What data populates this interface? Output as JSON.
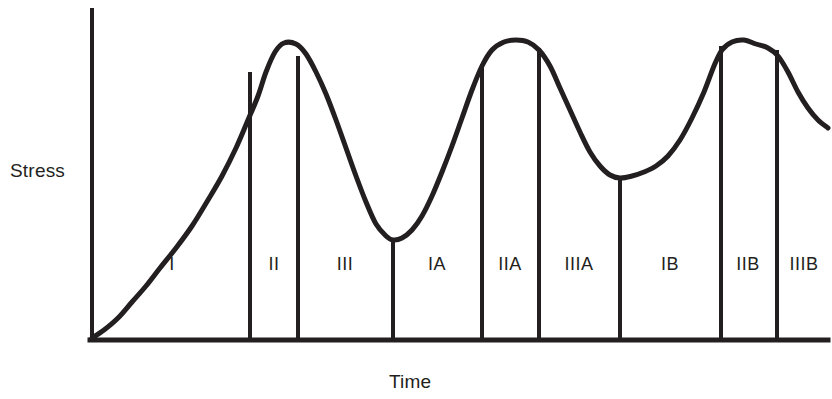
{
  "figure": {
    "background_color": "#ffffff",
    "ink_color": "#231f20"
  },
  "axes": {
    "y_axis_label": "Stress",
    "x_axis_label": "Time",
    "y_axis": {
      "x": 92,
      "y_top": 10,
      "y_bottom": 340
    },
    "x_axis": {
      "y": 340,
      "x_left": 92,
      "x_right": 828
    }
  },
  "stage_labels": [
    {
      "text": "I",
      "x": 172,
      "y": 254
    },
    {
      "text": "II",
      "x": 274,
      "y": 254
    },
    {
      "text": "III",
      "x": 345,
      "y": 254
    },
    {
      "text": "IA",
      "x": 437,
      "y": 254
    },
    {
      "text": "IIA",
      "x": 510,
      "y": 254
    },
    {
      "text": "IIIA",
      "x": 579,
      "y": 254
    },
    {
      "text": "IB",
      "x": 670,
      "y": 254
    },
    {
      "text": "IIB",
      "x": 748,
      "y": 254
    },
    {
      "text": "IIIB",
      "x": 804,
      "y": 254
    }
  ],
  "dividers": [
    {
      "x": 250,
      "y_top": 72,
      "label_after": "II"
    },
    {
      "x": 298,
      "y_top": 56,
      "label_after": "III"
    },
    {
      "x": 393,
      "y_top": 240,
      "label_after": "IA"
    },
    {
      "x": 482,
      "y_top": 64,
      "label_after": "IIA"
    },
    {
      "x": 539,
      "y_top": 48,
      "label_after": "IIIA"
    },
    {
      "x": 620,
      "y_top": 178,
      "label_after": "IB"
    },
    {
      "x": 721,
      "y_top": 46,
      "label_after": "IIB"
    },
    {
      "x": 777,
      "y_top": 50,
      "label_after": "IIIB"
    }
  ],
  "chart_data": {
    "type": "line",
    "title": "",
    "xlabel": "Time",
    "ylabel": "Stress",
    "xlim": [
      92,
      828
    ],
    "ylim": [
      340,
      10
    ],
    "grid": false,
    "legend": null,
    "axis_units": "qualitative (no numeric tick labels)",
    "annotations": [
      "I",
      "II",
      "III",
      "IA",
      "IIA",
      "IIIA",
      "IB",
      "IIB",
      "IIIB"
    ],
    "series": [
      {
        "name": "stress-over-time",
        "description": "General adaptation syndrome style repeating stress curve: three successive rise-peak-decline cycles with progressively shallower recovery valleys.",
        "points": [
          [
            92,
            338
          ],
          [
            104,
            330
          ],
          [
            118,
            318
          ],
          [
            132,
            302
          ],
          [
            146,
            286
          ],
          [
            160,
            268
          ],
          [
            176,
            248
          ],
          [
            192,
            226
          ],
          [
            208,
            200
          ],
          [
            222,
            176
          ],
          [
            236,
            148
          ],
          [
            248,
            120
          ],
          [
            258,
            96
          ],
          [
            266,
            72
          ],
          [
            275,
            52
          ],
          [
            284,
            43
          ],
          [
            296,
            44
          ],
          [
            306,
            54
          ],
          [
            316,
            72
          ],
          [
            326,
            94
          ],
          [
            336,
            120
          ],
          [
            346,
            148
          ],
          [
            356,
            176
          ],
          [
            366,
            202
          ],
          [
            376,
            224
          ],
          [
            386,
            236
          ],
          [
            393,
            240
          ],
          [
            402,
            238
          ],
          [
            412,
            230
          ],
          [
            422,
            216
          ],
          [
            432,
            196
          ],
          [
            442,
            172
          ],
          [
            452,
            146
          ],
          [
            462,
            118
          ],
          [
            472,
            90
          ],
          [
            482,
            66
          ],
          [
            492,
            50
          ],
          [
            504,
            42
          ],
          [
            516,
            40
          ],
          [
            528,
            42
          ],
          [
            539,
            50
          ],
          [
            550,
            66
          ],
          [
            560,
            88
          ],
          [
            570,
            110
          ],
          [
            580,
            132
          ],
          [
            590,
            152
          ],
          [
            600,
            166
          ],
          [
            610,
            175
          ],
          [
            620,
            178
          ],
          [
            632,
            176
          ],
          [
            644,
            172
          ],
          [
            656,
            166
          ],
          [
            668,
            156
          ],
          [
            680,
            140
          ],
          [
            692,
            118
          ],
          [
            704,
            92
          ],
          [
            714,
            66
          ],
          [
            722,
            50
          ],
          [
            732,
            42
          ],
          [
            744,
            40
          ],
          [
            756,
            44
          ],
          [
            768,
            48
          ],
          [
            778,
            56
          ],
          [
            788,
            72
          ],
          [
            798,
            92
          ],
          [
            808,
            108
          ],
          [
            818,
            120
          ],
          [
            828,
            128
          ]
        ]
      }
    ]
  }
}
